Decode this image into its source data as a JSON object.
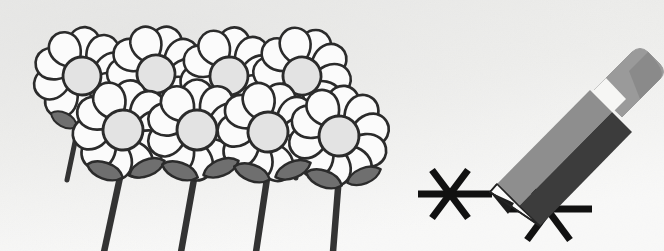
{
  "scene": {
    "title": "Line drawing of eight daisy flowers beside a pencil drawing asterisk marks",
    "width": 664,
    "height": 251,
    "alt_text": "Black and white illustration: a cluster of eight white daisies with gray centers, dark stems and gray leaves on the left; on the right a gray and black pencil with a light gray eraser draws two six-pointed asterisk star marks."
  },
  "palette": {
    "background_top": "#e9e9e7",
    "background_bottom": "#fdfdfd",
    "paper_texture": "#e4e4e2",
    "ink": "#2b2b2b",
    "ink_soft": "#3a3a3a",
    "petal_fill": "#fbfbfb",
    "petal_shade": "#f2f2f2",
    "flower_center": "#e3e3e3",
    "leaf_gray": "#6f6f6f",
    "leaf_gray_dark": "#5c5c5c",
    "stem_dark": "#333333",
    "pencil_body_dark": "#3c3c3c",
    "pencil_body_light": "#8e8e8e",
    "pencil_eraser": "#9a9a9a",
    "pencil_eraser_edge": "#7c7c7c",
    "pencil_tip_white": "#fafafa",
    "pencil_lead": "#1d1d1d",
    "mark_black": "#111111"
  },
  "flowers": {
    "back_row_label": "back-row-daisies",
    "front_row_label": "front-row-daisies",
    "petal_count": 10,
    "back_row": [
      {
        "id": "daisy-back-1",
        "cx": 82,
        "cy": 76,
        "r_petal": 46,
        "r_center": 19,
        "rotation": 4
      },
      {
        "id": "daisy-back-2",
        "cx": 156,
        "cy": 74,
        "r_petal": 46,
        "r_center": 19,
        "rotation": 18
      },
      {
        "id": "daisy-back-3",
        "cx": 229,
        "cy": 76,
        "r_petal": 46,
        "r_center": 19,
        "rotation": 9
      },
      {
        "id": "daisy-back-4",
        "cx": 302,
        "cy": 76,
        "r_petal": 46,
        "r_center": 19,
        "rotation": 24
      }
    ],
    "front_row": [
      {
        "id": "daisy-front-1",
        "cx": 123,
        "cy": 130,
        "r_petal": 47,
        "r_center": 20,
        "rotation": 12
      },
      {
        "id": "daisy-front-2",
        "cx": 197,
        "cy": 130,
        "r_petal": 47,
        "r_center": 20,
        "rotation": 0
      },
      {
        "id": "daisy-front-3",
        "cx": 268,
        "cy": 132,
        "r_petal": 47,
        "r_center": 20,
        "rotation": 20
      },
      {
        "id": "daisy-front-4",
        "cx": 339,
        "cy": 136,
        "r_petal": 47,
        "r_center": 20,
        "rotation": 7
      }
    ],
    "stems": [
      {
        "id": "stem-back-1",
        "x1": 80,
        "y1": 118,
        "x2": 67,
        "y2": 178,
        "width": 5
      },
      {
        "id": "stem-front-1",
        "x1": 122,
        "y1": 172,
        "x2": 104,
        "y2": 251,
        "width": 6
      },
      {
        "id": "stem-front-2",
        "x1": 196,
        "y1": 172,
        "x2": 180,
        "y2": 251,
        "width": 6
      },
      {
        "id": "stem-front-3",
        "x1": 268,
        "y1": 174,
        "x2": 256,
        "y2": 251,
        "width": 6
      },
      {
        "id": "stem-front-4",
        "x1": 339,
        "y1": 178,
        "x2": 332,
        "y2": 251,
        "width": 6
      },
      {
        "id": "stem-back-2",
        "x1": 156,
        "y1": 116,
        "x2": 146,
        "y2": 170,
        "width": 5
      },
      {
        "id": "stem-back-3",
        "x1": 229,
        "y1": 118,
        "x2": 222,
        "y2": 172,
        "width": 5
      },
      {
        "id": "stem-back-4",
        "x1": 302,
        "y1": 118,
        "x2": 296,
        "y2": 176,
        "width": 5
      }
    ],
    "leaves": [
      {
        "id": "leaf-back-1-left",
        "cx": 63,
        "cy": 120,
        "rx": 15,
        "ry": 9,
        "rot": 25
      },
      {
        "id": "leaf-front-1-left",
        "cx": 104,
        "cy": 170,
        "rx": 19,
        "ry": 11,
        "rot": 22
      },
      {
        "id": "leaf-front-1-right",
        "cx": 146,
        "cy": 168,
        "rx": 19,
        "ry": 11,
        "rot": -20
      },
      {
        "id": "leaf-front-2-left",
        "cx": 178,
        "cy": 170,
        "rx": 19,
        "ry": 11,
        "rot": 22
      },
      {
        "id": "leaf-front-2-right",
        "cx": 220,
        "cy": 168,
        "rx": 19,
        "ry": 11,
        "rot": -20
      },
      {
        "id": "leaf-front-3-left",
        "cx": 250,
        "cy": 172,
        "rx": 19,
        "ry": 11,
        "rot": 22
      },
      {
        "id": "leaf-front-3-right",
        "cx": 292,
        "cy": 170,
        "rx": 19,
        "ry": 11,
        "rot": -20
      },
      {
        "id": "leaf-front-4-left",
        "cx": 322,
        "cy": 178,
        "rx": 19,
        "ry": 11,
        "rot": 22
      },
      {
        "id": "leaf-front-4-right",
        "cx": 362,
        "cy": 176,
        "rx": 18,
        "ry": 11,
        "rot": -20
      }
    ]
  },
  "pencil": {
    "label": "pencil",
    "angle_degrees": -48,
    "body_dark_label": "pencil-body-dark-face",
    "body_light_label": "pencil-body-light-face",
    "eraser_label": "pencil-eraser",
    "tip_label": "pencil-tip",
    "lead_point": {
      "x": 490,
      "y": 192
    },
    "eraser_corner": {
      "x": 648,
      "y": 58
    }
  },
  "marks": {
    "label": "drawn-asterisk-marks",
    "count": 2,
    "stroke_width": 7,
    "items": [
      {
        "id": "asterisk-left",
        "cx": 450,
        "cy": 194,
        "radius": 30,
        "tail_x": 492,
        "has_drawn_tail": true
      },
      {
        "id": "asterisk-right",
        "cx": 548,
        "cy": 211,
        "radius": 33,
        "tail_x": 0,
        "has_drawn_tail": false
      }
    ]
  }
}
